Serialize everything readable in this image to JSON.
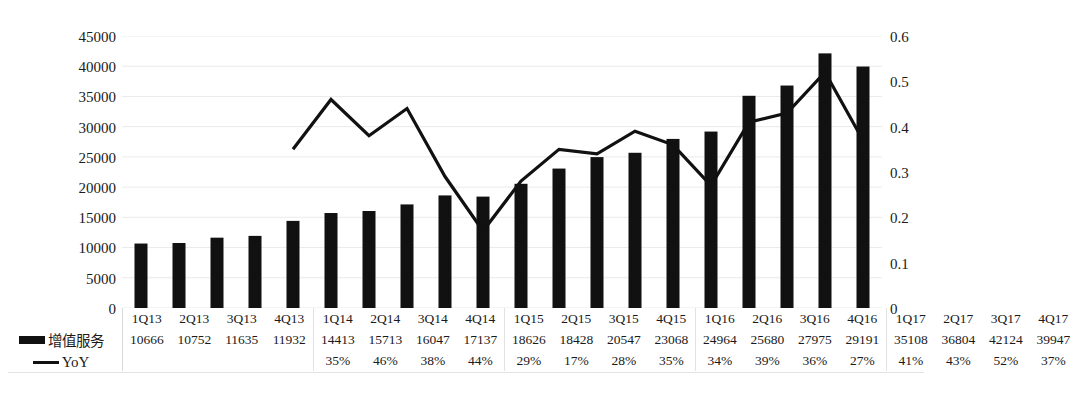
{
  "chart_data": {
    "type": "bar",
    "title": "",
    "subtitle": "",
    "xlabel": "",
    "ylabel": "",
    "y2label": "",
    "categories": [
      "1Q13",
      "2Q13",
      "3Q13",
      "4Q13",
      "1Q14",
      "2Q14",
      "3Q14",
      "4Q14",
      "1Q15",
      "2Q15",
      "3Q15",
      "4Q15",
      "1Q16",
      "2Q16",
      "3Q16",
      "4Q16",
      "1Q17",
      "2Q17",
      "3Q17",
      "4Q17"
    ],
    "series": [
      {
        "name": "增值服务",
        "type": "bar",
        "axis": "left",
        "color": "#111111",
        "values": [
          10666,
          10752,
          11635,
          11932,
          14413,
          15713,
          16047,
          17137,
          18626,
          18428,
          20547,
          23068,
          24964,
          25680,
          27975,
          29191,
          35108,
          36804,
          42124,
          39947
        ]
      },
      {
        "name": "YoY",
        "type": "line",
        "axis": "right",
        "color": "#111111",
        "value_labels": [
          null,
          null,
          null,
          null,
          "35%",
          "46%",
          "38%",
          "44%",
          "29%",
          "17%",
          "28%",
          "35%",
          "34%",
          "39%",
          "36%",
          "27%",
          "41%",
          "43%",
          "52%",
          "37%"
        ],
        "values": [
          null,
          null,
          null,
          null,
          0.35,
          0.46,
          0.38,
          0.44,
          0.29,
          0.17,
          0.28,
          0.35,
          0.34,
          0.39,
          0.36,
          0.27,
          0.41,
          0.43,
          0.52,
          0.37
        ]
      }
    ],
    "ylim": [
      0,
      45000
    ],
    "y2lim": [
      0,
      0.6
    ],
    "yticks": [
      "0",
      "5000",
      "10000",
      "15000",
      "20000",
      "25000",
      "30000",
      "35000",
      "40000",
      "45000"
    ],
    "y2ticks": [
      "0",
      "0.1",
      "0.2",
      "0.3",
      "0.4",
      "0.5",
      "0.6"
    ],
    "grid": true,
    "grid_color": "#e8e8e8",
    "legend_position": "bottom-left-table"
  },
  "legend": {
    "bar_label": "增值服务",
    "line_label": "YoY",
    "bar_icon": "bar-swatch-icon",
    "line_icon": "line-swatch-icon"
  },
  "axis": {
    "left_ticks": [
      "45000",
      "40000",
      "35000",
      "30000",
      "25000",
      "20000",
      "15000",
      "10000",
      "5000",
      "0"
    ],
    "right_ticks": [
      "0.6",
      "0.5",
      "0.4",
      "0.3",
      "0.2",
      "0.1",
      "0"
    ]
  },
  "table": {
    "row_quarters": [
      "1Q13",
      "2Q13",
      "3Q13",
      "4Q13",
      "1Q14",
      "2Q14",
      "3Q14",
      "4Q14",
      "1Q15",
      "2Q15",
      "3Q15",
      "4Q15",
      "1Q16",
      "2Q16",
      "3Q16",
      "4Q16",
      "1Q17",
      "2Q17",
      "3Q17",
      "4Q17"
    ],
    "row_values": [
      "10666",
      "10752",
      "11635",
      "11932",
      "14413",
      "15713",
      "16047",
      "17137",
      "18626",
      "18428",
      "20547",
      "23068",
      "24964",
      "25680",
      "27975",
      "29191",
      "35108",
      "36804",
      "42124",
      "39947"
    ],
    "row_yoy": [
      "",
      "",
      "",
      "",
      "35%",
      "46%",
      "38%",
      "44%",
      "29%",
      "17%",
      "28%",
      "35%",
      "34%",
      "39%",
      "36%",
      "27%",
      "41%",
      "43%",
      "52%",
      "37%"
    ]
  },
  "colors": {
    "bar": "#111111",
    "line": "#111111",
    "grid": "#e8e8e8",
    "text": "#1a1a1a",
    "background": "#ffffff"
  }
}
